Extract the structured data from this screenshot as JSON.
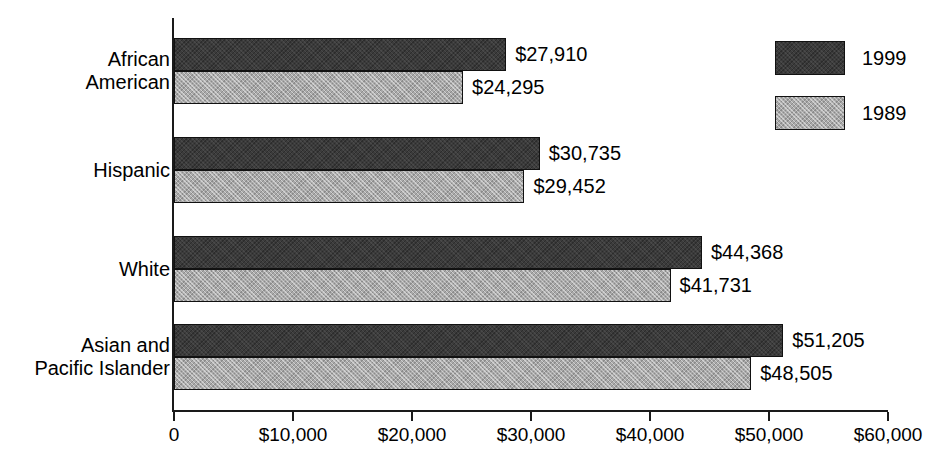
{
  "chart_data": {
    "type": "bar",
    "orientation": "horizontal",
    "title": "",
    "subtitle": "",
    "xlabel": "",
    "ylabel": "",
    "xlim": [
      0,
      60000
    ],
    "grid": false,
    "legend_position": "top-right",
    "categories": [
      "African\nAmerican",
      "Hispanic",
      "White",
      "Asian and\nPacific Islander"
    ],
    "category_lines": [
      [
        "African",
        "American"
      ],
      [
        "Hispanic"
      ],
      [
        "White"
      ],
      [
        "Asian and",
        "Pacific Islander"
      ]
    ],
    "tick_values": [
      0,
      10000,
      20000,
      30000,
      40000,
      50000,
      60000
    ],
    "tick_labels": [
      "0",
      "$10,000",
      "$20,000",
      "$30,000",
      "$40,000",
      "$50,000",
      "$60,000"
    ],
    "series": [
      {
        "name": "1999",
        "color": "#3b3b3b",
        "values": [
          27910,
          30735,
          44368,
          51205
        ],
        "labels": [
          "$27,910",
          "$30,735",
          "$44,368",
          "$51,205"
        ]
      },
      {
        "name": "1989",
        "color": "#a9a9a9",
        "values": [
          24295,
          29452,
          41731,
          48505
        ],
        "labels": [
          "$24,295",
          "$29,452",
          "$41,731",
          "$48,505"
        ]
      }
    ]
  },
  "legend": {
    "entries": [
      {
        "label": "1999",
        "color": "#3b3b3b"
      },
      {
        "label": "1989",
        "color": "#a9a9a9"
      }
    ]
  }
}
